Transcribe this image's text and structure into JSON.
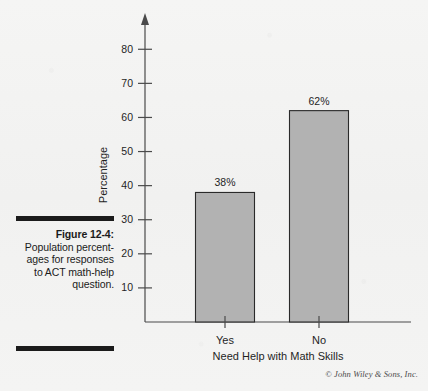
{
  "caption": {
    "label": "Figure 12-4:",
    "body": "Population percent-ages for responses to ACT math-help question."
  },
  "copyright": "© John Wiley & Sons, Inc.",
  "colors": {
    "bar_fill": "#b2b2b2",
    "bar_stroke": "#2a2a2a",
    "axis": "#4a4a4a",
    "text": "#1f1f1f",
    "background": "#f3f3f2",
    "rule": "#1b1b1b"
  },
  "chart_data": {
    "type": "bar",
    "title": "",
    "categories": [
      "Yes",
      "No"
    ],
    "values": [
      38,
      62
    ],
    "data_labels": [
      "38%",
      "62%"
    ],
    "xlabel": "Need Help with Math Skills",
    "ylabel": "Percentage",
    "ylim": [
      0,
      88
    ],
    "yticks": [
      10,
      20,
      30,
      40,
      50,
      60,
      70,
      80
    ],
    "ytick_labels": [
      "10",
      "20",
      "30",
      "40",
      "50",
      "60",
      "70",
      "80"
    ],
    "grid": false,
    "legend": false,
    "y_axis_arrow": true
  }
}
